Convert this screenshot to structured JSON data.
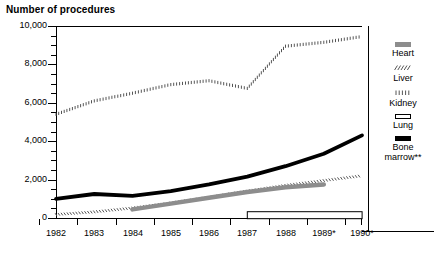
{
  "chart_data": {
    "type": "line",
    "title": "Number of procedures",
    "xlabel": "",
    "ylabel": "",
    "ylim": [
      0,
      10000
    ],
    "xlim": [
      1982,
      1990
    ],
    "grid": false,
    "legend_position": "right",
    "y_ticks_major": [
      "0",
      "2,000",
      "4,000",
      "6,000",
      "8,000",
      "10,000"
    ],
    "y_tick_values": [
      0,
      2000,
      4000,
      6000,
      8000,
      10000
    ],
    "y_minor_interval": 500,
    "categories": [
      "1982",
      "1983",
      "1984",
      "1985",
      "1986",
      "1987",
      "1988",
      "1989*",
      "1990*"
    ],
    "x": [
      1982,
      1983,
      1984,
      1985,
      1986,
      1987,
      1988,
      1989,
      1990
    ],
    "series": [
      {
        "name": "Kidney",
        "style": "vertical-hatch",
        "color": "#555555",
        "values": [
          5400,
          6100,
          6500,
          6950,
          7150,
          6750,
          8950,
          9150,
          9450
        ]
      },
      {
        "name": "Bone marrow**",
        "style": "solid-thick",
        "color": "#000000",
        "values": [
          1000,
          1250,
          1150,
          1400,
          1750,
          2150,
          2700,
          3350,
          4300
        ]
      },
      {
        "name": "Liver",
        "style": "diagonal-hatch",
        "color": "#555555",
        "values": [
          180,
          320,
          520,
          780,
          1080,
          1400,
          1700,
          1950,
          2200
        ]
      },
      {
        "name": "Heart",
        "style": "gray-band",
        "color": "#8d8d8d",
        "values": [
          null,
          null,
          450,
          750,
          1050,
          1350,
          1600,
          1750,
          null
        ]
      },
      {
        "name": "Lung",
        "style": "outline-bar",
        "color": "#ffffff",
        "values": [
          null,
          null,
          null,
          null,
          null,
          120,
          120,
          120,
          120
        ]
      }
    ],
    "legend": [
      {
        "label": "Heart",
        "swatch": "gray-bar"
      },
      {
        "label": "Liver",
        "swatch": "diagonal-hatch"
      },
      {
        "label": "Kidney",
        "swatch": "vertical-hatch"
      },
      {
        "label": "Lung",
        "swatch": "outline-bar"
      },
      {
        "label": "Bone",
        "label2": "marrow**",
        "swatch": "black-bar"
      }
    ]
  }
}
